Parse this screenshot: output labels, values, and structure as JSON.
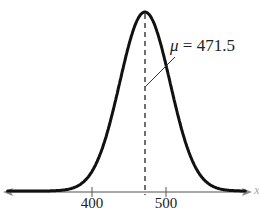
{
  "chart_data": {
    "type": "line",
    "title": "",
    "subtitle": "Normal distribution curve",
    "xlabel": "x",
    "ylabel": "",
    "xlim": [
      282,
      613
    ],
    "grid": false,
    "legend": null,
    "distribution": {
      "kind": "normal",
      "mean": 471.5,
      "std_dev_approx": 34
    },
    "x_ticks": [
      400,
      500
    ],
    "tick_labels": [
      "400",
      "500"
    ],
    "annotations": [
      {
        "text": "μ = 471.5",
        "symbol": "μ",
        "value": "471.5",
        "target_x": 471.5,
        "style": "dashed vertical line at mean"
      }
    ],
    "series": [
      {
        "name": "density",
        "x": [
          282,
          380,
          400,
          420,
          440,
          460,
          471.5,
          483,
          503,
          523,
          543,
          563,
          613
        ],
        "y_relative": [
          0.0,
          0.03,
          0.11,
          0.32,
          0.65,
          0.94,
          1.0,
          0.94,
          0.65,
          0.32,
          0.11,
          0.03,
          0.0
        ]
      }
    ]
  },
  "labels": {
    "mu_symbol": "μ",
    "mu_text": " = 471.5",
    "tick_400": "400",
    "tick_500": "500",
    "axis_var": "x"
  },
  "colors": {
    "curve": "#111111",
    "axis": "#8a8a8a",
    "dashed": "#333333"
  }
}
